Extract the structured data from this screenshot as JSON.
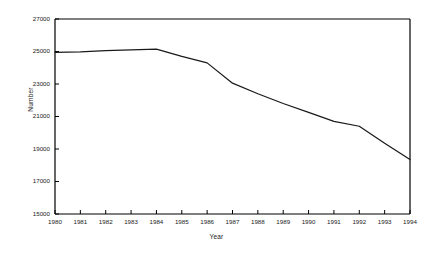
{
  "chart_data": {
    "type": "line",
    "title": "",
    "xlabel": "Year",
    "ylabel": "Number",
    "x": [
      1980,
      1981,
      1982,
      1983,
      1984,
      1985,
      1986,
      1987,
      1988,
      1989,
      1990,
      1991,
      1992,
      1993,
      1994
    ],
    "categories": [
      "1980",
      "1981",
      "1982",
      "1983",
      "1984",
      "1985",
      "1986",
      "1987",
      "1988",
      "1989",
      "1990",
      "1991",
      "1992",
      "1993",
      "1994"
    ],
    "values": [
      24950,
      24980,
      25050,
      25100,
      25150,
      24700,
      24300,
      23050,
      22400,
      21800,
      21250,
      20700,
      20400,
      19350,
      18350
    ],
    "series": [
      {
        "name": "Number",
        "values": [
          24950,
          24980,
          25050,
          25100,
          25150,
          24700,
          24300,
          23050,
          22400,
          21800,
          21250,
          20700,
          20400,
          19350,
          18350
        ]
      }
    ],
    "xlim": [
      1980,
      1994
    ],
    "ylim": [
      15000,
      27000
    ],
    "ytick_values": [
      15000,
      17000,
      19000,
      21000,
      23000,
      25000,
      27000
    ],
    "ytick_labels": [
      "15000",
      "17000",
      "19000",
      "21000",
      "23000",
      "25000",
      "27000"
    ],
    "xtick_labels": [
      "1980",
      "1981",
      "1982",
      "1983",
      "1984",
      "1985",
      "1986",
      "1987",
      "1988",
      "1989",
      "1990",
      "1991",
      "1992",
      "1993",
      "1994"
    ],
    "grid": false,
    "legend": false,
    "legend_position": "none",
    "line_color": "#1a1a1a",
    "axis_color": "#000000",
    "background_color": "#ffffff"
  }
}
